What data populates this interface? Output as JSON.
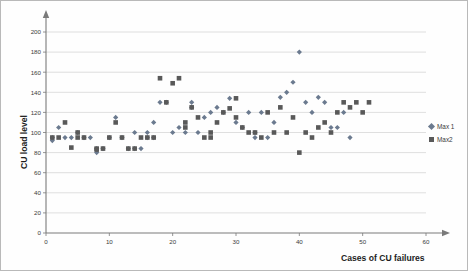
{
  "chart_data": {
    "type": "scatter",
    "title": "",
    "xlabel": "Cases of CU failures",
    "ylabel": "CU load level",
    "xlim": [
      0,
      60
    ],
    "ylim": [
      0,
      200
    ],
    "xticks": [
      0,
      10,
      20,
      30,
      40,
      50,
      60
    ],
    "yticks": [
      0,
      20,
      40,
      60,
      80,
      100,
      120,
      140,
      160,
      180,
      200
    ],
    "grid": "horizontal",
    "legend_position": "right",
    "series": [
      {
        "name": "Max 1",
        "marker": "diamond",
        "color": "#6b7a8f",
        "points": [
          [
            1,
            95
          ],
          [
            1,
            92
          ],
          [
            2,
            105
          ],
          [
            3,
            95
          ],
          [
            4,
            95
          ],
          [
            5,
            100
          ],
          [
            6,
            95
          ],
          [
            7,
            95
          ],
          [
            8,
            80
          ],
          [
            8,
            84
          ],
          [
            9,
            84
          ],
          [
            10,
            95
          ],
          [
            11,
            115
          ],
          [
            12,
            95
          ],
          [
            13,
            84
          ],
          [
            14,
            100
          ],
          [
            14,
            84
          ],
          [
            15,
            84
          ],
          [
            16,
            95
          ],
          [
            16,
            100
          ],
          [
            17,
            95
          ],
          [
            17,
            110
          ],
          [
            18,
            130
          ],
          [
            19,
            130
          ],
          [
            20,
            100
          ],
          [
            21,
            105
          ],
          [
            22,
            100
          ],
          [
            23,
            125
          ],
          [
            23,
            130
          ],
          [
            24,
            100
          ],
          [
            25,
            115
          ],
          [
            26,
            120
          ],
          [
            27,
            125
          ],
          [
            28,
            120
          ],
          [
            29,
            134
          ],
          [
            30,
            110
          ],
          [
            31,
            105
          ],
          [
            32,
            120
          ],
          [
            33,
            100
          ],
          [
            33,
            95
          ],
          [
            34,
            120
          ],
          [
            35,
            95
          ],
          [
            36,
            110
          ],
          [
            37,
            135
          ],
          [
            38,
            140
          ],
          [
            39,
            150
          ],
          [
            40,
            180
          ],
          [
            41,
            130
          ],
          [
            42,
            120
          ],
          [
            43,
            135
          ],
          [
            44,
            130
          ],
          [
            45,
            105
          ],
          [
            46,
            105
          ],
          [
            47,
            120
          ],
          [
            48,
            95
          ]
        ]
      },
      {
        "name": "Max2",
        "marker": "square",
        "color": "#595959",
        "points": [
          [
            1,
            95
          ],
          [
            2,
            95
          ],
          [
            3,
            110
          ],
          [
            4,
            85
          ],
          [
            5,
            100
          ],
          [
            5,
            95
          ],
          [
            6,
            95
          ],
          [
            8,
            84
          ],
          [
            8,
            83
          ],
          [
            9,
            84
          ],
          [
            10,
            95
          ],
          [
            11,
            110
          ],
          [
            12,
            95
          ],
          [
            13,
            84
          ],
          [
            14,
            84
          ],
          [
            15,
            95
          ],
          [
            16,
            95
          ],
          [
            17,
            95
          ],
          [
            18,
            154
          ],
          [
            19,
            130
          ],
          [
            20,
            149
          ],
          [
            21,
            154
          ],
          [
            22,
            105
          ],
          [
            22,
            110
          ],
          [
            23,
            125
          ],
          [
            24,
            115
          ],
          [
            25,
            95
          ],
          [
            26,
            100
          ],
          [
            26,
            95
          ],
          [
            27,
            110
          ],
          [
            28,
            120
          ],
          [
            29,
            124
          ],
          [
            30,
            134
          ],
          [
            30,
            115
          ],
          [
            31,
            105
          ],
          [
            32,
            100
          ],
          [
            33,
            100
          ],
          [
            34,
            95
          ],
          [
            35,
            120
          ],
          [
            36,
            100
          ],
          [
            37,
            125
          ],
          [
            38,
            100
          ],
          [
            39,
            115
          ],
          [
            40,
            80
          ],
          [
            41,
            100
          ],
          [
            42,
            95
          ],
          [
            43,
            105
          ],
          [
            44,
            110
          ],
          [
            45,
            100
          ],
          [
            46,
            120
          ],
          [
            47,
            130
          ],
          [
            48,
            125
          ],
          [
            49,
            130
          ],
          [
            50,
            120
          ],
          [
            51,
            130
          ]
        ]
      }
    ]
  },
  "legend": {
    "items": [
      {
        "label": "Max 1",
        "marker": "diamond",
        "color": "#6b7a8f"
      },
      {
        "label": "Max2",
        "marker": "square",
        "color": "#595959"
      }
    ]
  },
  "axes": {
    "x_title": "Cases of CU failures",
    "y_title": "CU load level"
  }
}
